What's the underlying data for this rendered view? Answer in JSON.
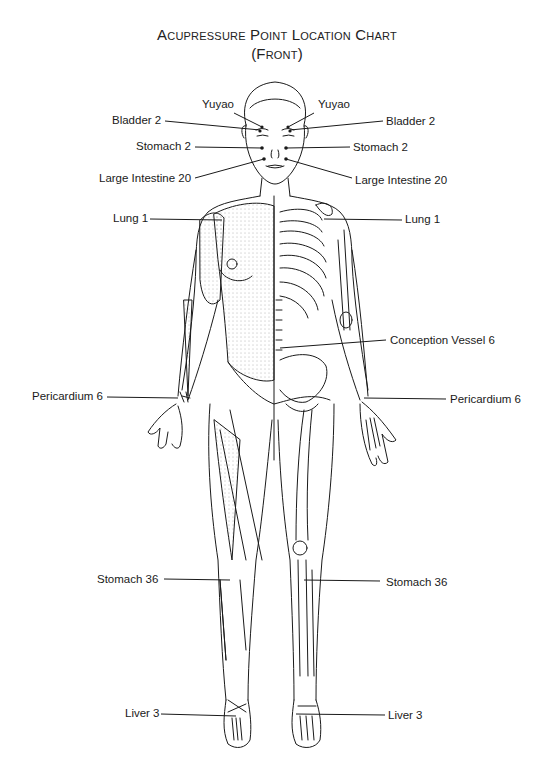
{
  "title": {
    "line1": "Acupressure Point Location Chart",
    "line2": "(Front)"
  },
  "colors": {
    "ink": "#1a1a1a",
    "background": "#ffffff",
    "stipple": "#555555"
  },
  "points": {
    "left": [
      {
        "id": "yuyao-l",
        "label": "Yuyao"
      },
      {
        "id": "bladder2-l",
        "label": "Bladder 2"
      },
      {
        "id": "stomach2-l",
        "label": "Stomach 2"
      },
      {
        "id": "li20-l",
        "label": "Large Intestine 20"
      },
      {
        "id": "lung1-l",
        "label": "Lung 1"
      },
      {
        "id": "pericardium6-l",
        "label": "Pericardium 6"
      },
      {
        "id": "stomach36-l",
        "label": "Stomach 36"
      },
      {
        "id": "liver3-l",
        "label": "Liver 3"
      }
    ],
    "right": [
      {
        "id": "yuyao-r",
        "label": "Yuyao"
      },
      {
        "id": "bladder2-r",
        "label": "Bladder 2"
      },
      {
        "id": "stomach2-r",
        "label": "Stomach 2"
      },
      {
        "id": "li20-r",
        "label": "Large Intestine 20"
      },
      {
        "id": "lung1-r",
        "label": "Lung 1"
      },
      {
        "id": "cv6",
        "label": "Conception Vessel 6"
      },
      {
        "id": "pericardium6-r",
        "label": "Pericardium 6"
      },
      {
        "id": "stomach36-r",
        "label": "Stomach 36"
      },
      {
        "id": "liver3-r",
        "label": "Liver 3"
      }
    ]
  }
}
